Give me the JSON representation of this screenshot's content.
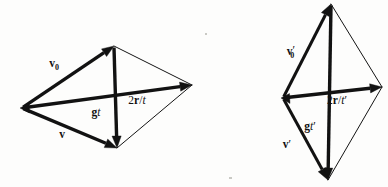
{
  "figure": {
    "background_color": "#fdfdfc",
    "ink_color": "#121212",
    "diagrams": [
      {
        "id": "left-diagram",
        "name": "wide-rhombus-diagram",
        "shape": "rhombus",
        "vertices": {
          "left": {
            "x": 22,
            "y": 108
          },
          "apex": {
            "x": 114,
            "y": 46
          },
          "right": {
            "x": 192,
            "y": 85
          },
          "bottom": {
            "x": 117,
            "y": 148
          }
        },
        "vectors": [
          {
            "name": "v0-vector",
            "label": "v",
            "subscript": "0",
            "prime": "",
            "italic_part": "",
            "from": "left",
            "to": "apex",
            "weight": "bold",
            "label_pos": {
              "x": 54,
              "y": 67
            }
          },
          {
            "name": "v-vector",
            "label": "v",
            "subscript": "",
            "prime": "",
            "italic_part": "",
            "from": "left",
            "to": "bottom",
            "weight": "bold",
            "label_pos": {
              "x": 62,
              "y": 138
            }
          },
          {
            "name": "gt-vector",
            "label": "g",
            "subscript": "",
            "prime": "",
            "italic_part": "t",
            "from": "apex",
            "to": "bottom",
            "weight": "bold",
            "label_pos": {
              "x": 96,
              "y": 116
            }
          },
          {
            "name": "2r-over-t-vector",
            "label": "2r/t",
            "subscript": "",
            "prime": "",
            "italic_part": "t",
            "from": "left",
            "to": "right",
            "weight": "bold",
            "label_pos": {
              "x": 137,
              "y": 104
            }
          }
        ],
        "thin_edges": [
          {
            "name": "apex-to-right-edge",
            "from": "apex",
            "to": "right"
          },
          {
            "name": "bottom-to-right-edge",
            "from": "bottom",
            "to": "right"
          }
        ]
      },
      {
        "id": "right-diagram",
        "name": "tall-rhombus-diagram",
        "shape": "rhombus",
        "vertices": {
          "left": {
            "x": 283,
            "y": 98
          },
          "apex": {
            "x": 331,
            "y": 4
          },
          "right": {
            "x": 382,
            "y": 87
          },
          "bottom": {
            "x": 328,
            "y": 180
          }
        },
        "vectors": [
          {
            "name": "v0-prime-vector",
            "label": "v",
            "subscript": "0",
            "prime": "'",
            "italic_part": "",
            "from": "left",
            "to": "apex",
            "weight": "bold",
            "label_pos": {
              "x": 291,
              "y": 55
            }
          },
          {
            "name": "v-prime-vector",
            "label": "v",
            "subscript": "",
            "prime": "'",
            "italic_part": "",
            "from": "left",
            "to": "bottom",
            "weight": "bold",
            "label_pos": {
              "x": 287,
              "y": 148
            }
          },
          {
            "name": "gt-prime-vector",
            "label": "g",
            "subscript": "",
            "prime": "'",
            "italic_part": "t",
            "from": "apex",
            "to": "bottom",
            "weight": "bold",
            "label_pos": {
              "x": 310,
              "y": 130
            }
          },
          {
            "name": "2r-over-t-prime-vector",
            "label": "2r/t",
            "subscript": "",
            "prime": "'",
            "italic_part": "t",
            "from": "left",
            "to": "right",
            "weight": "bold",
            "label_pos": {
              "x": 337,
              "y": 104
            }
          }
        ],
        "thin_edges": [
          {
            "name": "apex-to-right-edge",
            "from": "apex",
            "to": "right"
          },
          {
            "name": "bottom-to-right-edge",
            "from": "bottom",
            "to": "right"
          }
        ]
      }
    ],
    "labels": {
      "left_v0": "v0",
      "left_v": "v",
      "left_gt": "gt",
      "left_2r_over_t": "2r/t",
      "right_v0_prime": "v0'",
      "right_v_prime": "v'",
      "right_gt_prime": "gt'",
      "right_2r_over_t_prime": "2r/t'"
    },
    "label_parts": {
      "v_bold": "v",
      "zero_sub": "0",
      "prime_mark": "′",
      "g_bold": "g",
      "t_ital": "t",
      "two": "2",
      "r_bold": "r",
      "slash": "/"
    }
  }
}
